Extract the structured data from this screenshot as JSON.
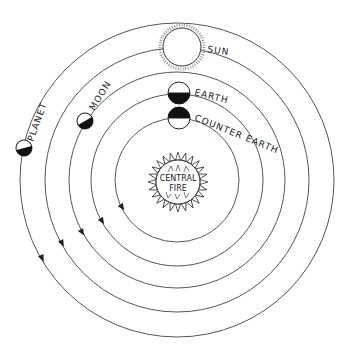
{
  "diagram": {
    "center": {
      "x": 177,
      "y": 180
    },
    "orbits": [
      {
        "name": "counter-earth-orbit",
        "r": 62,
        "arrow": {
          "x": 122,
          "y": 207,
          "angle": 120
        }
      },
      {
        "name": "earth-orbit",
        "r": 86,
        "arrow": {
          "x": 102,
          "y": 220,
          "angle": 118
        }
      },
      {
        "name": "moon-orbit",
        "r": 108,
        "arrow": {
          "x": 82,
          "y": 231,
          "angle": 115
        }
      },
      {
        "name": "sun-orbit",
        "r": 132,
        "arrow": {
          "x": 62,
          "y": 243,
          "angle": 113
        }
      },
      {
        "name": "planet-orbit",
        "r": 157,
        "arrow": {
          "x": 42,
          "y": 258,
          "angle": 110
        }
      }
    ],
    "bodies": {
      "central_fire": {
        "label_line1": "CENTRAL",
        "label_line2": "FIRE"
      },
      "counter_earth": {
        "label": "COUNTER EARTH"
      },
      "earth": {
        "label": "EARTH"
      },
      "moon": {
        "label": "MOON"
      },
      "sun": {
        "label": "SUN"
      },
      "planet": {
        "label": "PLANET"
      }
    }
  }
}
